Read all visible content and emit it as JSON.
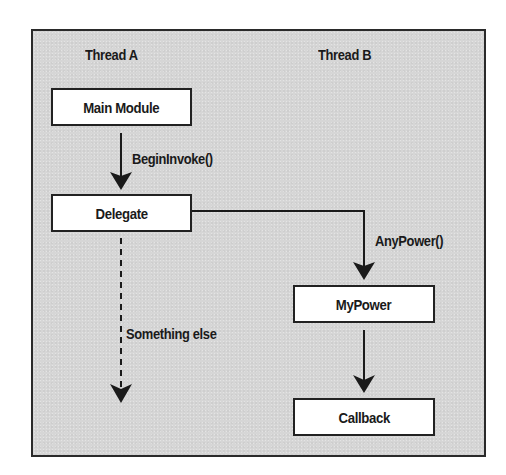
{
  "diagram": {
    "type": "thread-flow",
    "colors": {
      "frame_background": "#d6d6d6",
      "frame_border": "#2a2a2a",
      "box_fill": "#ffffff",
      "stroke": "#1a1a1a",
      "text": "#1a1a1a"
    },
    "lanes": [
      {
        "id": "thread-a",
        "label": "Thread A"
      },
      {
        "id": "thread-b",
        "label": "Thread B"
      }
    ],
    "nodes": [
      {
        "id": "main-module",
        "label": "Main Module",
        "lane": "thread-a"
      },
      {
        "id": "delegate",
        "label": "Delegate",
        "lane": "thread-a"
      },
      {
        "id": "mypower",
        "label": "MyPower",
        "lane": "thread-b"
      },
      {
        "id": "callback",
        "label": "Callback",
        "lane": "thread-b"
      }
    ],
    "edges": [
      {
        "from": "main-module",
        "to": "delegate",
        "label": "BeginInvoke()",
        "style": "solid"
      },
      {
        "from": "delegate",
        "to": "mypower",
        "label": "AnyPower()",
        "style": "solid"
      },
      {
        "from": "delegate",
        "to": null,
        "label": "Something else",
        "style": "dashed"
      },
      {
        "from": "mypower",
        "to": "callback",
        "label": "",
        "style": "solid"
      }
    ]
  }
}
